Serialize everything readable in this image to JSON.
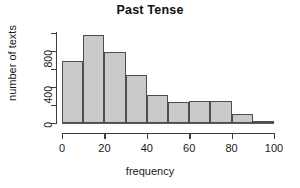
{
  "chart_data": {
    "type": "bar",
    "title": "Past Tense",
    "xlabel": "frequency",
    "ylabel": "number of texts",
    "grid": false,
    "legend": null,
    "bin_width": 10,
    "categories": [
      "0-10",
      "10-20",
      "20-30",
      "30-40",
      "40-50",
      "50-60",
      "60-70",
      "70-80",
      "80-90",
      "90-100"
    ],
    "bin_edges": [
      0,
      10,
      20,
      30,
      40,
      50,
      60,
      70,
      80,
      90,
      100
    ],
    "values": [
      690,
      970,
      790,
      525,
      310,
      225,
      235,
      235,
      100,
      15
    ],
    "xlim": [
      0,
      100
    ],
    "ylim": [
      0,
      1000
    ],
    "xticks": [
      0,
      20,
      40,
      60,
      80,
      100
    ],
    "xtick_labels": [
      "0",
      "20",
      "40",
      "60",
      "80",
      "100"
    ],
    "yticks": [
      0,
      200,
      400,
      600,
      800,
      1000
    ],
    "ytick_labels": [
      "0",
      "",
      "400",
      "",
      "800",
      ""
    ],
    "bar_fill_color": "#c9c9c9",
    "bar_border_color": "#4d4d4d",
    "axis_color": "#3d3d3d",
    "background_color": "#ffffff"
  }
}
